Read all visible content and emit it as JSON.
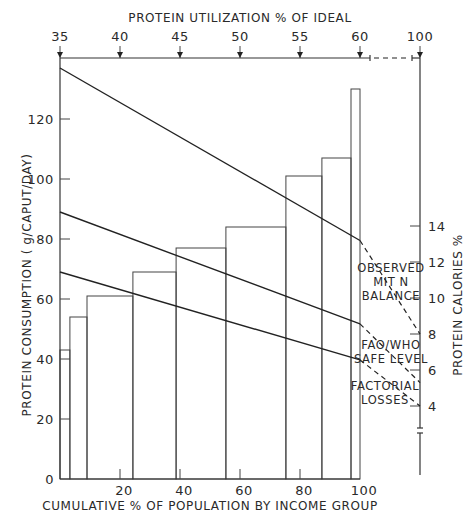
{
  "chart_data": {
    "type": "bar",
    "subtype": "histogram-with-lines",
    "title": "",
    "xlabel": "CUMULATIVE % OF POPULATION BY INCOME GROUP",
    "ylabel": "PROTEIN CONSUMPTION ( g/CAPUT/DAY)",
    "top_xlabel": "PROTEIN UTILIZATION % OF IDEAL",
    "right_ylabel": "PROTEIN CALORIES %",
    "xlim": [
      0,
      100
    ],
    "ylim": [
      0,
      140
    ],
    "x_ticks": [
      0,
      20,
      40,
      60,
      80,
      100
    ],
    "x_tick_labels": [
      "",
      "20",
      "40",
      "60",
      "80",
      "100"
    ],
    "y_ticks": [
      0,
      20,
      40,
      60,
      80,
      100,
      120
    ],
    "y_tick_labels": [
      "0",
      "20",
      "40",
      "60",
      "80",
      "100",
      "120"
    ],
    "top_ticks": [
      35,
      40,
      45,
      50,
      55,
      60,
      100
    ],
    "top_tick_labels": [
      "35",
      "40",
      "45",
      "50",
      "55",
      "60",
      "100"
    ],
    "right_ticks": [
      4,
      6,
      8,
      10,
      12,
      14
    ],
    "right_tick_labels": [
      "4",
      "6",
      "8",
      "10",
      "12",
      "14"
    ],
    "grid": false,
    "bars": [
      {
        "x_start": 0,
        "x_end": 3.3,
        "value": 43
      },
      {
        "x_start": 3.3,
        "x_end": 9,
        "value": 54
      },
      {
        "x_start": 9,
        "x_end": 24.3,
        "value": 61
      },
      {
        "x_start": 24.3,
        "x_end": 38.7,
        "value": 69
      },
      {
        "x_start": 38.7,
        "x_end": 55.3,
        "value": 77
      },
      {
        "x_start": 55.3,
        "x_end": 75.3,
        "value": 84
      },
      {
        "x_start": 75.3,
        "x_end": 87.3,
        "value": 101
      },
      {
        "x_start": 87.3,
        "x_end": 97,
        "value": 107
      },
      {
        "x_start": 97,
        "x_end": 100,
        "value": 130
      }
    ],
    "series": [
      {
        "name": "OBSERVED MIT N BALANCE",
        "label_lines": [
          "OBSERVED",
          "MIT N",
          "BALANCE"
        ],
        "start": {
          "x": 0,
          "y": 137
        },
        "end": {
          "x": 100,
          "y": 79.5
        },
        "protein_calories_end": 8
      },
      {
        "name": "FAO/WHO SAFE LEVEL",
        "label_lines": [
          "FAO/WHO",
          "SAFE LEVEL"
        ],
        "start": {
          "x": 0,
          "y": 89
        },
        "end": {
          "x": 100,
          "y": 51.7
        },
        "protein_calories_end": 5.3
      },
      {
        "name": "FACTORIAL LOSSES",
        "label_lines": [
          "FACTORIAL",
          "LOSSES"
        ],
        "start": {
          "x": 0,
          "y": 69
        },
        "end": {
          "x": 100,
          "y": 39.7
        },
        "protein_calories_end": 4
      }
    ]
  }
}
